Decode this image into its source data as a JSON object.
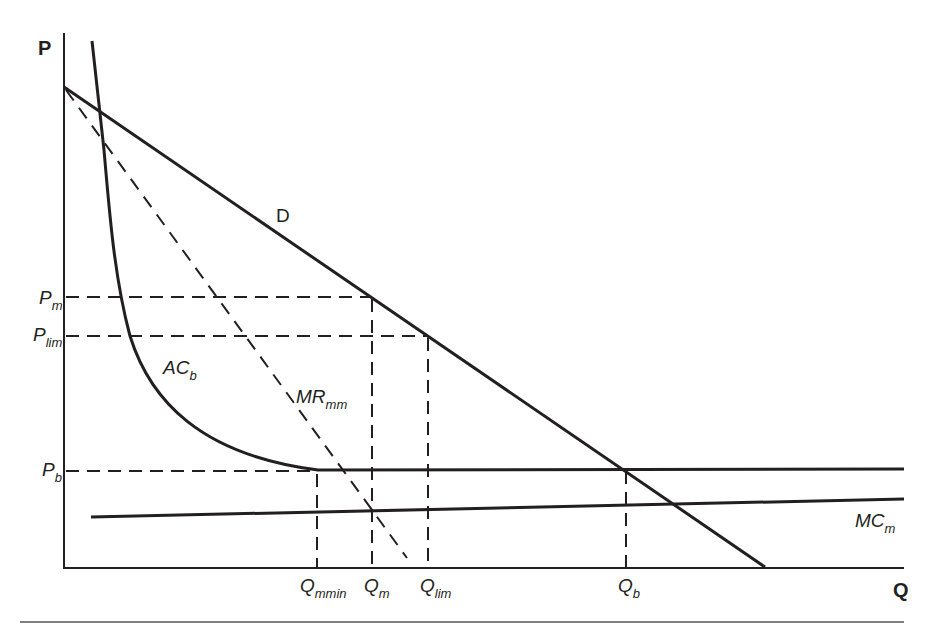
{
  "diagram": {
    "type": "economics-limit-pricing",
    "axes": {
      "y_label": "P",
      "x_label": "Q"
    },
    "price_levels": [
      {
        "id": "pm",
        "main": "P",
        "sub": "m",
        "y": 297
      },
      {
        "id": "plim",
        "main": "P",
        "sub": "lim",
        "y": 336
      },
      {
        "id": "pb",
        "main": "P",
        "sub": "b",
        "y": 471
      }
    ],
    "quantity_levels": [
      {
        "id": "qmmin",
        "main": "Q",
        "sub": "mmin",
        "x": 317
      },
      {
        "id": "qm",
        "main": "Q",
        "sub": "m",
        "x": 372
      },
      {
        "id": "qlim",
        "main": "Q",
        "sub": "lim",
        "x": 428
      },
      {
        "id": "qb",
        "main": "Q",
        "sub": "b",
        "x": 626
      }
    ],
    "curves": {
      "demand": {
        "main": "D",
        "sub": ""
      },
      "marginal_revenue": {
        "main": "MR",
        "sub": "mm"
      },
      "average_cost": {
        "main": "AC",
        "sub": "b"
      },
      "marginal_cost": {
        "main": "MC",
        "sub": "m"
      }
    },
    "colors": {
      "ink": "#231f20",
      "background": "#ffffff"
    }
  }
}
